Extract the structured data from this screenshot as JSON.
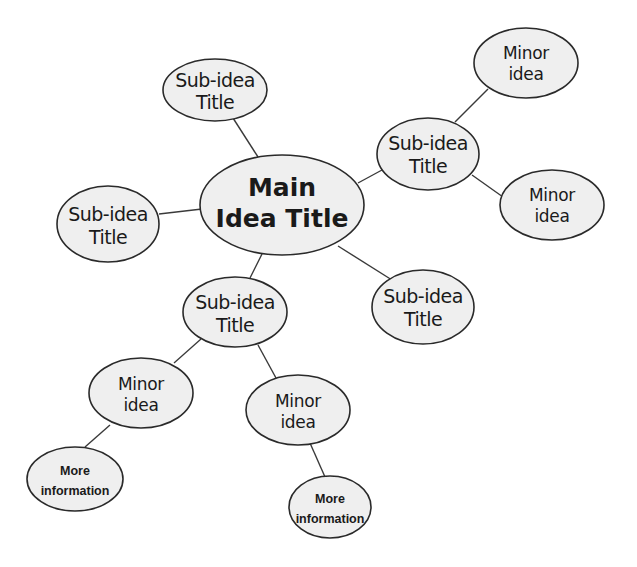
{
  "diagram": {
    "type": "mind-map",
    "colors": {
      "node_fill": "#efefef",
      "node_stroke": "#2a2a2a",
      "edge": "#3a3a3a",
      "background": "#ffffff"
    },
    "main": {
      "line1": "Main",
      "line2": "Idea Title"
    },
    "nodes": {
      "sub_top": {
        "line1": "Sub-idea",
        "line2": "Title"
      },
      "sub_right": {
        "line1": "Sub-idea",
        "line2": "Title"
      },
      "sub_left": {
        "line1": "Sub-idea",
        "line2": "Title"
      },
      "sub_bottom": {
        "line1": "Sub-idea",
        "line2": "Title"
      },
      "sub_bottom_right": {
        "line1": "Sub-idea",
        "line2": "Title"
      },
      "minor_top_right": {
        "line1": "Minor",
        "line2": "idea"
      },
      "minor_right": {
        "line1": "Minor",
        "line2": "idea"
      },
      "minor_left": {
        "line1": "Minor",
        "line2": "idea"
      },
      "minor_mid": {
        "line1": "Minor",
        "line2": "idea"
      },
      "info_left": {
        "line1": "More",
        "line2": "information"
      },
      "info_right": {
        "line1": "More",
        "line2": "information"
      }
    },
    "edges": [
      [
        "main",
        "sub_top"
      ],
      [
        "main",
        "sub_right"
      ],
      [
        "main",
        "sub_left"
      ],
      [
        "main",
        "sub_bottom"
      ],
      [
        "main",
        "sub_bottom_right"
      ],
      [
        "sub_right",
        "minor_top_right"
      ],
      [
        "sub_right",
        "minor_right"
      ],
      [
        "sub_bottom",
        "minor_left"
      ],
      [
        "sub_bottom",
        "minor_mid"
      ],
      [
        "minor_left",
        "info_left"
      ],
      [
        "minor_mid",
        "info_right"
      ]
    ]
  }
}
